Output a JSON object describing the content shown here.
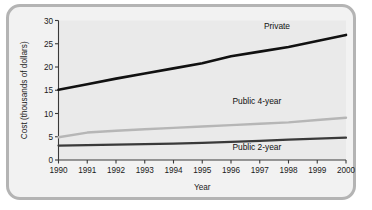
{
  "figure": {
    "border_color": "#b4b4b4",
    "background_color": "#f2f2f2",
    "plot_background_color": "#eaeaea"
  },
  "chart_data": {
    "type": "line",
    "title": "",
    "xlabel": "Year",
    "ylabel": "Cost (thousands of dollars)",
    "x": [
      1990,
      1991,
      1992,
      1993,
      1994,
      1995,
      1996,
      1997,
      1998,
      1999,
      2000
    ],
    "categories": [
      "1990",
      "1991",
      "1992",
      "1993",
      "1994",
      "1995",
      "1996",
      "1997",
      "1998",
      "1999",
      "2000"
    ],
    "xlim": [
      1990,
      2000
    ],
    "ylim": [
      0,
      30
    ],
    "yticks": [
      0,
      5,
      10,
      15,
      20,
      25,
      30
    ],
    "ytick_labels": [
      "0",
      "5",
      "10",
      "15",
      "20",
      "25",
      "30"
    ],
    "xtick_labels": [
      "1990",
      "1991",
      "1992",
      "1993",
      "1994",
      "1995",
      "1996",
      "1997",
      "1998",
      "1999",
      "2000"
    ],
    "grid": false,
    "legend_position": "inline-right-of-series",
    "series": [
      {
        "name": "Private",
        "color": "#111111",
        "width": 2.6,
        "values": [
          15.1,
          16.3,
          17.5,
          18.6,
          19.7,
          20.8,
          22.3,
          23.3,
          24.3,
          25.6,
          26.9
        ],
        "label_x": 1997.6,
        "label_y": 28.2
      },
      {
        "name": "Public 4-year",
        "color": "#b6b6b6",
        "width": 2.4,
        "values": [
          4.9,
          5.9,
          6.3,
          6.6,
          6.9,
          7.2,
          7.5,
          7.8,
          8.1,
          8.6,
          9.1
        ],
        "label_x": 1996.9,
        "label_y": 12.1
      },
      {
        "name": "Public 2-year",
        "color": "#3a3a3a",
        "width": 2.2,
        "values": [
          3.1,
          3.2,
          3.3,
          3.4,
          3.5,
          3.7,
          3.9,
          4.1,
          4.4,
          4.6,
          4.8
        ],
        "label_x": 1996.9,
        "label_y": 2.2
      }
    ]
  }
}
